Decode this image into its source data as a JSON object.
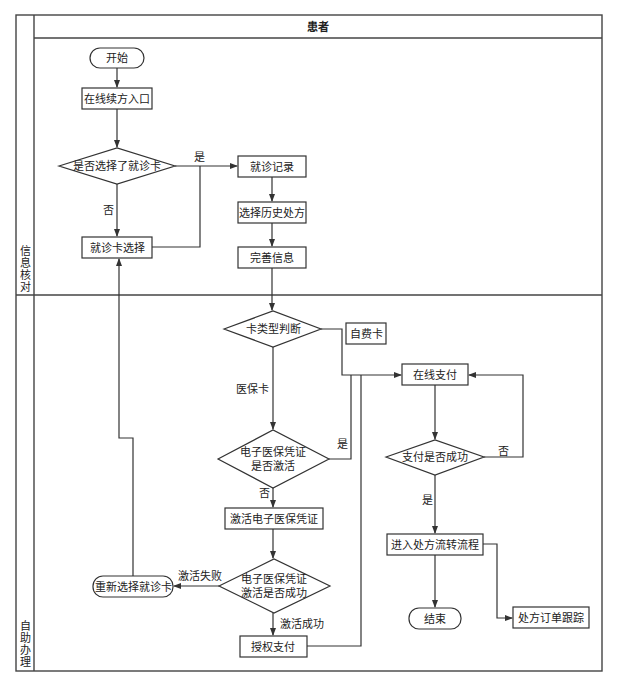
{
  "header": {
    "title": "患者"
  },
  "lanes": [
    {
      "label_chars": [
        "信",
        "息",
        "核",
        "对"
      ]
    },
    {
      "label_chars": [
        "自",
        "助",
        "办",
        "理"
      ]
    }
  ],
  "nodes": {
    "start": "开始",
    "entry": "在线续方入口",
    "decision_card_selected": "是否选择了就诊卡",
    "visit_record": "就诊记录",
    "select_history": "选择历史处方",
    "complete_info": "完善信息",
    "card_select": "就诊卡选择",
    "card_type": "卡类型判断",
    "self_pay_card": "自费卡",
    "online_pay": "在线支付",
    "ehic_activated_line1": "电子医保凭证",
    "ehic_activated_line2": "是否激活",
    "activate_ehic": "激活电子医保凭证",
    "activate_ok_line1": "电子医保凭证",
    "activate_ok_line2": "激活是否成功",
    "reselect_card": "重新选择就诊卡",
    "authorize_pay": "授权支付",
    "pay_success": "支付是否成功",
    "enter_flow": "进入处方流转流程",
    "end": "结束",
    "order_track": "处方订单跟踪"
  },
  "edge_labels": {
    "yes1": "是",
    "no1": "否",
    "medical_card": "医保卡",
    "yes2": "是",
    "no2": "否",
    "activate_fail": "激活失败",
    "activate_success": "激活成功",
    "pay_no": "否",
    "pay_yes": "是"
  }
}
